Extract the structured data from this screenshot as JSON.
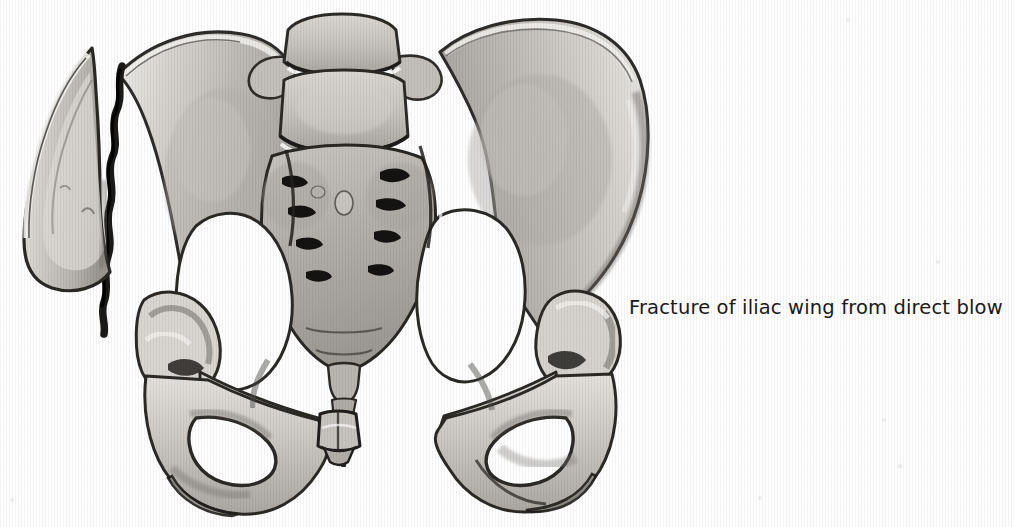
{
  "page": {
    "width": 1014,
    "height": 527,
    "background_color": "#ffffff",
    "media": "grayscale medical illustration scan"
  },
  "caption": {
    "text": "Fracture of iliac wing from direct blow",
    "color": "#1a1a1a",
    "x": 629,
    "y": 296,
    "font_size_px": 19.5
  },
  "cut_off_header": {
    "text": "",
    "note": "row of descenders only, clipped by top edge of page"
  },
  "illustration": {
    "title": "Anterior view of bony pelvis with fractured left iliac wing",
    "view": "anterior (AP)",
    "palette": {
      "bone_light": "#dedbd6",
      "bone_mid": "#c2bfba",
      "bone_shade": "#a7a49f",
      "bone_deep": "#8d8a85",
      "outline": "#3a3835",
      "outline_dark": "#1f1e1c",
      "highlight": "#f2f0ed",
      "void": "#ffffff",
      "fracture_gap": "#24221f"
    },
    "parts": [
      {
        "name": "l5-vertebra",
        "label": "L5 vertebral body"
      },
      {
        "name": "sacrum",
        "label": "Sacrum"
      },
      {
        "name": "sacral-foramina",
        "label": "Sacral foramina",
        "count": 8
      },
      {
        "name": "coccyx",
        "label": "Coccyx"
      },
      {
        "name": "right-iliac-wing",
        "label": "Right iliac wing (intact)"
      },
      {
        "name": "left-iliac-wing",
        "label": "Left iliac wing (fractured)"
      },
      {
        "name": "displaced-iliac-fragment",
        "label": "Displaced iliac wing fragment"
      },
      {
        "name": "fracture-line",
        "label": "Fracture line"
      },
      {
        "name": "left-acetabulum",
        "label": "Left acetabulum"
      },
      {
        "name": "right-acetabulum",
        "label": "Right acetabulum"
      },
      {
        "name": "left-obturator-foramen",
        "label": "Left obturator foramen"
      },
      {
        "name": "right-obturator-foramen",
        "label": "Right obturator foramen"
      },
      {
        "name": "pubic-symphysis",
        "label": "Pubic symphysis"
      },
      {
        "name": "left-ischial-tuberosity",
        "label": "Left ischial tuberosity"
      },
      {
        "name": "right-ischial-tuberosity",
        "label": "Right ischial tuberosity"
      },
      {
        "name": "pelvic-inlet",
        "label": "Pelvic inlet"
      }
    ]
  }
}
